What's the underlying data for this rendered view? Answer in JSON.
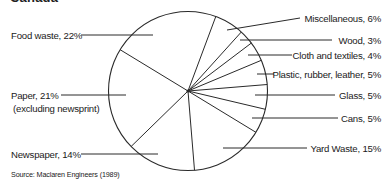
{
  "chart_data": {
    "type": "pie",
    "title": "Canada",
    "source": "Source: Maclaren Engineers (1989)",
    "start_angle_deg": 20.5,
    "direction": "clockwise",
    "slices": [
      {
        "label": "Miscellaneous",
        "value": 6,
        "text": "Miscellaneous, 6%"
      },
      {
        "label": "Wood",
        "value": 3,
        "text": "Wood, 3%"
      },
      {
        "label": "Cloth and textiles",
        "value": 4,
        "text": "Cloth and textiles, 4%"
      },
      {
        "label": "Plastic, rubber, leather",
        "value": 5,
        "text": "Plastic, rubber, leather, 5%"
      },
      {
        "label": "Glass",
        "value": 5,
        "text": "Glass, 5%"
      },
      {
        "label": "Cans",
        "value": 5,
        "text": "Cans, 5%"
      },
      {
        "label": "Yard Waste",
        "value": 15,
        "text": "Yard Waste, 15%"
      },
      {
        "label": "Newspaper",
        "value": 14,
        "text": "Newspaper, 14%"
      },
      {
        "label": "Paper (excluding newsprint)",
        "value": 21,
        "text": "Paper, 21%",
        "subtext": "(excluding newsprint)"
      },
      {
        "label": "Food waste",
        "value": 22,
        "text": "Food waste, 22%"
      }
    ],
    "legend": "none (leader-line labels)",
    "grid": false
  },
  "labels": {
    "title": "Canada",
    "misc": "Miscellaneous, 6%",
    "wood": "Wood, 3%",
    "cloth": "Cloth and textiles, 4%",
    "plastic": "Plastic, rubber, leather, 5%",
    "glass": "Glass, 5%",
    "cans": "Cans, 5%",
    "yard": "Yard Waste, 15%",
    "newspaper": "Newspaper, 14%",
    "paper": "Paper, 21%",
    "paper_sub": "(excluding newsprint)",
    "food": "Food waste, 22%",
    "source": "Source: Maclaren Engineers (1989)"
  },
  "colors": {
    "stroke": "#2a2a2a",
    "text": "#1a1a1a",
    "background": "#ffffff"
  }
}
